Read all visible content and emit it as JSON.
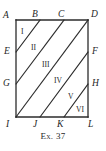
{
  "figure": {
    "caption": "Ex. 37",
    "shape_name": "rectangle-with-parallel-diagonals",
    "stroke_color": "#2b2b2b",
    "fill_color": "#ffffff",
    "vertices": [
      {
        "id": "A",
        "label": "A",
        "x": 16,
        "y": 20,
        "label_x": 3,
        "label_y": 11
      },
      {
        "id": "B",
        "label": "B",
        "x": 40,
        "y": 20,
        "label_x": 32,
        "label_y": 10
      },
      {
        "id": "C",
        "label": "C",
        "x": 64,
        "y": 20,
        "label_x": 58,
        "label_y": 10
      },
      {
        "id": "D",
        "label": "D",
        "x": 88,
        "y": 20,
        "label_x": 91,
        "label_y": 10
      },
      {
        "id": "E",
        "label": "E",
        "x": 16,
        "y": 52,
        "label_x": 4,
        "label_y": 47
      },
      {
        "id": "F",
        "label": "F",
        "x": 88,
        "y": 52,
        "label_x": 92,
        "label_y": 47
      },
      {
        "id": "G",
        "label": "G",
        "x": 16,
        "y": 84,
        "label_x": 3,
        "label_y": 79
      },
      {
        "id": "H",
        "label": "H",
        "x": 88,
        "y": 84,
        "label_x": 92,
        "label_y": 79
      },
      {
        "id": "I",
        "label": "I",
        "x": 16,
        "y": 117,
        "label_x": 6,
        "label_y": 120
      },
      {
        "id": "J",
        "label": "J",
        "x": 40,
        "y": 117,
        "label_x": 33,
        "label_y": 120
      },
      {
        "id": "K",
        "label": "K",
        "x": 64,
        "y": 117,
        "label_x": 57,
        "label_y": 120
      },
      {
        "id": "L",
        "label": "L",
        "x": 88,
        "y": 117,
        "label_x": 88,
        "label_y": 120
      }
    ],
    "edges": [
      {
        "id": "top",
        "from": "A",
        "to": "D"
      },
      {
        "id": "right",
        "from": "D",
        "to": "L"
      },
      {
        "id": "bottom",
        "from": "L",
        "to": "I"
      },
      {
        "id": "left",
        "from": "I",
        "to": "A"
      }
    ],
    "diagonals": [
      {
        "id": "EB",
        "from": "E",
        "to": "B"
      },
      {
        "id": "GC",
        "from": "G",
        "to": "C"
      },
      {
        "id": "ID",
        "from": "I",
        "to": "D"
      },
      {
        "id": "JF",
        "from": "J",
        "to": "F"
      },
      {
        "id": "KH",
        "from": "K",
        "to": "H"
      }
    ],
    "regions": [
      {
        "id": "r1",
        "label": "I",
        "x": 21,
        "y": 28
      },
      {
        "id": "r2",
        "label": "II",
        "x": 31,
        "y": 44
      },
      {
        "id": "r3",
        "label": "III",
        "x": 42,
        "y": 61
      },
      {
        "id": "r4",
        "label": "IV",
        "x": 54,
        "y": 77
      },
      {
        "id": "r5",
        "label": "V",
        "x": 68,
        "y": 93
      },
      {
        "id": "r6",
        "label": "VI",
        "x": 76,
        "y": 106
      }
    ]
  }
}
